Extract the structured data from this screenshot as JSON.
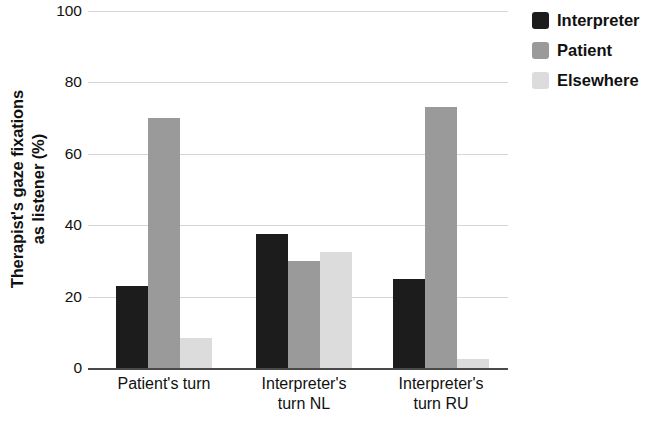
{
  "chart_data": {
    "type": "bar",
    "title": "",
    "subtitle": "",
    "xlabel": "",
    "ylabel": "Therapist's gaze fixations as listener (%)",
    "ylabel_line1": "Therapist's gaze fixations",
    "ylabel_line2": "as listener (%)",
    "ylim": [
      0,
      100
    ],
    "yticks": [
      0,
      20,
      40,
      60,
      80,
      100
    ],
    "ytick_labels": [
      "0",
      "20",
      "40",
      "60",
      "80",
      "100"
    ],
    "grid": "horizontal",
    "legend_position": "top-right",
    "categories": [
      "Patient's turn",
      "Interpreter's turn NL",
      "Interpreter's turn RU"
    ],
    "category_lines": [
      [
        "Patient's turn"
      ],
      [
        "Interpreter's",
        "turn NL"
      ],
      [
        "Interpreter's",
        "turn RU"
      ]
    ],
    "series": [
      {
        "name": "Interpreter",
        "color": "#1c1c1c",
        "values": [
          23,
          37.5,
          25
        ]
      },
      {
        "name": "Patient",
        "color": "#9a9a9a",
        "values": [
          70,
          30,
          73
        ]
      },
      {
        "name": "Elsewhere",
        "color": "#dcdcdc",
        "values": [
          8.5,
          32.5,
          2.5
        ]
      }
    ]
  },
  "legend": {
    "items": [
      {
        "label": "Interpreter",
        "color": "#1c1c1c"
      },
      {
        "label": "Patient",
        "color": "#9a9a9a"
      },
      {
        "label": "Elsewhere",
        "color": "#dcdcdc"
      }
    ]
  }
}
